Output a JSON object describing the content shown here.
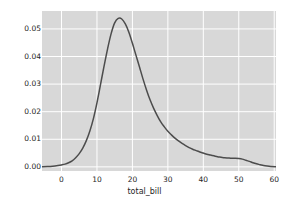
{
  "chart_data": {
    "type": "line",
    "title": "",
    "subtitle": "",
    "xlabel": "total_bill",
    "ylabel": "",
    "xlim": [
      -5.5,
      60.5
    ],
    "ylim": [
      -0.0015,
      0.0565
    ],
    "xticks": [
      0,
      10,
      20,
      30,
      40,
      50,
      60
    ],
    "xtick_labels": [
      "0",
      "10",
      "20",
      "30",
      "40",
      "50",
      "60"
    ],
    "yticks": [
      0.0,
      0.01,
      0.02,
      0.03,
      0.04,
      0.05
    ],
    "ytick_labels": [
      "0.00",
      "0.01",
      "0.02",
      "0.03",
      "0.04",
      "0.05"
    ],
    "grid": true,
    "grid_color": "#ffffff",
    "axes_facecolor": "#d8d8d8",
    "figure_facecolor": "#ffffff",
    "line_color": "#4c4c4c",
    "line_width": 1.5,
    "legend": null,
    "series": [
      {
        "name": "total_bill density",
        "x": [
          -5.5,
          -4,
          -2.5,
          -1,
          0,
          1,
          2,
          3,
          4,
          5,
          6,
          7,
          8,
          9,
          10,
          11,
          12,
          13,
          14,
          15,
          16,
          17,
          18,
          19,
          20,
          21,
          22,
          23,
          24,
          25,
          26,
          27,
          28,
          29,
          30,
          31,
          32,
          33,
          34,
          35,
          36,
          37,
          38,
          39,
          40,
          41,
          42,
          43,
          44,
          45,
          46,
          47,
          48,
          49,
          50,
          51,
          52,
          53,
          54,
          55,
          56,
          57,
          58,
          59,
          60.5
        ],
        "y": [
          5e-05,
          0.00012,
          0.00025,
          0.00048,
          0.0007,
          0.001,
          0.0015,
          0.0022,
          0.0033,
          0.0048,
          0.0068,
          0.0095,
          0.013,
          0.0175,
          0.0232,
          0.0298,
          0.0365,
          0.0428,
          0.0483,
          0.0522,
          0.0538,
          0.0536,
          0.0518,
          0.0488,
          0.0448,
          0.0405,
          0.0362,
          0.0318,
          0.0278,
          0.0242,
          0.0212,
          0.0186,
          0.0163,
          0.0145,
          0.0129,
          0.0116,
          0.0104,
          0.0094,
          0.0085,
          0.0077,
          0.007,
          0.0064,
          0.0059,
          0.0054,
          0.005,
          0.0046,
          0.0043,
          0.004,
          0.0037,
          0.0035,
          0.0033,
          0.0032,
          0.0031,
          0.0031,
          0.003,
          0.0028,
          0.0024,
          0.002,
          0.0015,
          0.0011,
          0.0008,
          0.0005,
          0.0003,
          0.00015,
          5e-05
        ]
      }
    ],
    "peak": {
      "x": 16,
      "y": 0.0538
    }
  },
  "axes": {
    "xlabel": "total_bill",
    "xtick_labels": [
      "0",
      "10",
      "20",
      "30",
      "40",
      "50",
      "60"
    ],
    "ytick_labels": [
      "0.00",
      "0.01",
      "0.02",
      "0.03",
      "0.04",
      "0.05"
    ]
  }
}
